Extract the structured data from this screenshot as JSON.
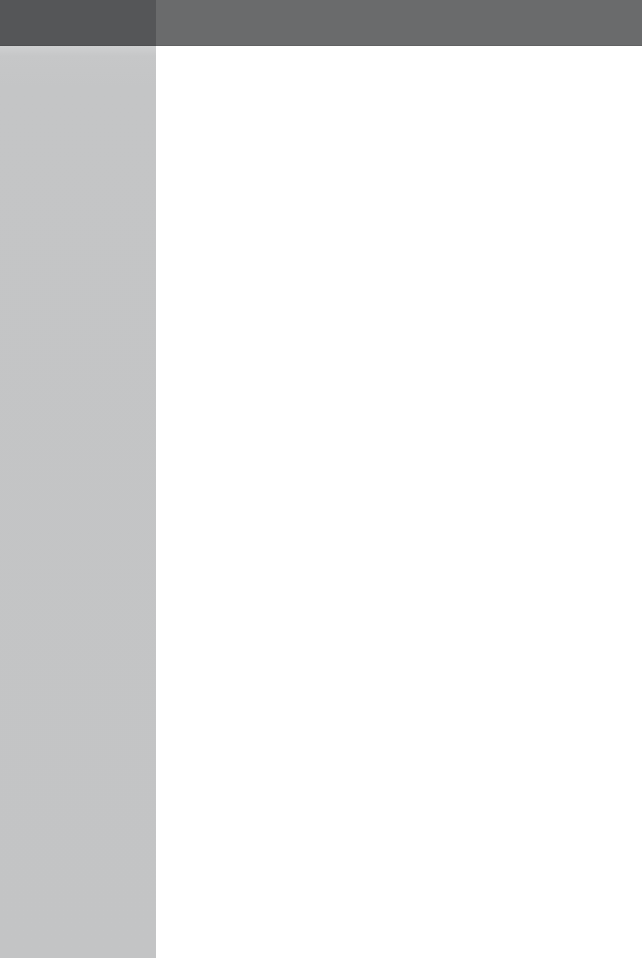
{
  "window": {
    "title": "",
    "width": 642,
    "height": 958,
    "state": "blank"
  },
  "colors": {
    "titlebar_left": "#555658",
    "titlebar_right": "#6a6b6c",
    "sidebar": "#c4c5c6",
    "content": "#ffffff"
  },
  "titlebar": {
    "left_label": "",
    "right_label": ""
  },
  "sidebar": {
    "heading": "",
    "items": []
  },
  "content": {
    "heading": "",
    "body_text": "",
    "items": []
  },
  "status": {
    "text": ""
  }
}
